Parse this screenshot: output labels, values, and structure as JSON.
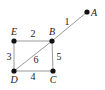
{
  "diagram": {
    "type": "weighted-graph",
    "nodes": [
      {
        "id": "A",
        "label": "A",
        "x": 87,
        "y": 12,
        "lx": 91,
        "ly": 16,
        "anchor": "start"
      },
      {
        "id": "B",
        "label": "B",
        "x": 52,
        "y": 41,
        "lx": 52,
        "ly": 35,
        "anchor": "middle"
      },
      {
        "id": "E",
        "label": "E",
        "x": 14,
        "y": 41,
        "lx": 14,
        "ly": 35,
        "anchor": "middle"
      },
      {
        "id": "D",
        "label": "D",
        "x": 14,
        "y": 71,
        "lx": 14,
        "ly": 83,
        "anchor": "middle"
      },
      {
        "id": "C",
        "label": "C",
        "x": 53,
        "y": 71,
        "lx": 53,
        "ly": 83,
        "anchor": "middle"
      }
    ],
    "edges": [
      {
        "from": "B",
        "to": "A",
        "weight": "1",
        "lx": 67,
        "ly": 25
      },
      {
        "from": "E",
        "to": "B",
        "weight": "2",
        "lx": 33,
        "ly": 37
      },
      {
        "from": "E",
        "to": "D",
        "weight": "3",
        "lx": 9,
        "ly": 60
      },
      {
        "from": "D",
        "to": "C",
        "weight": "4",
        "lx": 33,
        "ly": 80
      },
      {
        "from": "B",
        "to": "C",
        "weight": "5",
        "lx": 59,
        "ly": 60
      },
      {
        "from": "D",
        "to": "B",
        "weight": "6",
        "lx": 36,
        "ly": 63
      }
    ]
  }
}
